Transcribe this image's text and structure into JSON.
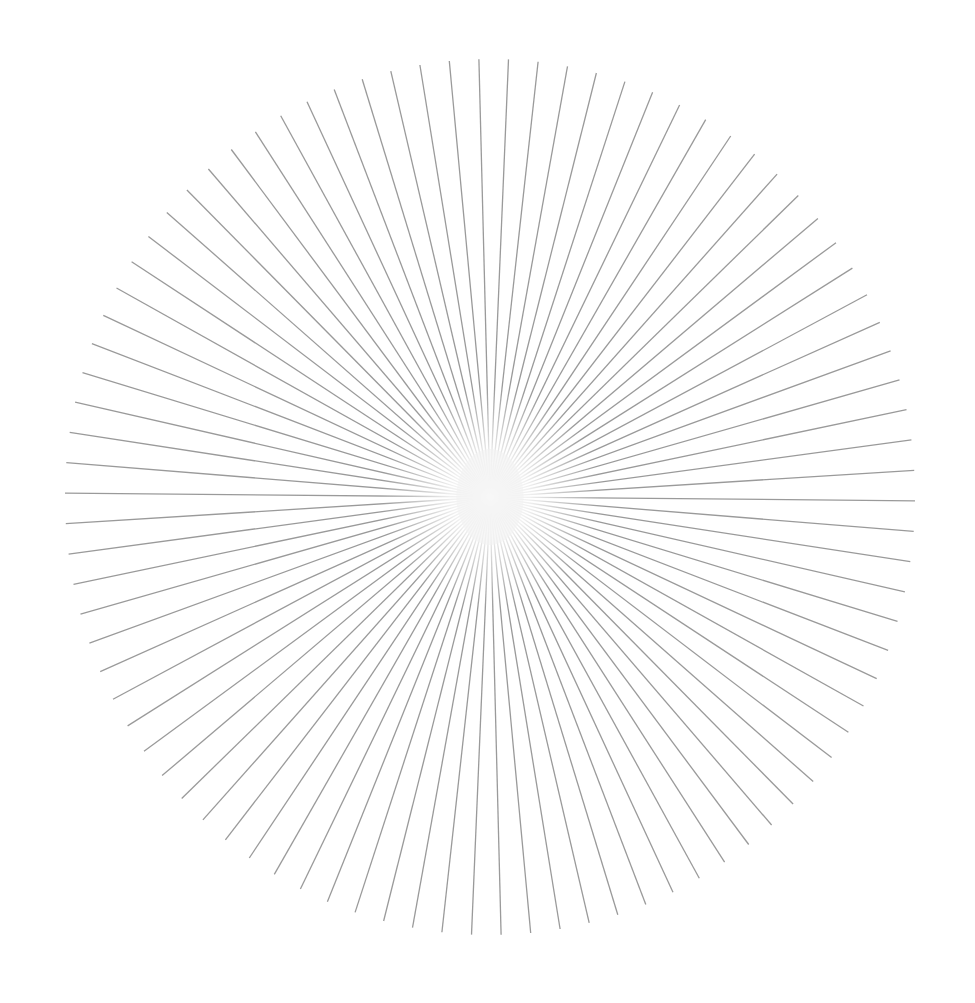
{
  "figure": {
    "type": "radial-starburst",
    "width": 975,
    "height": 1003,
    "background": "#ffffff",
    "center": {
      "x": 490,
      "y": 497
    },
    "radius_x": 425,
    "radius_y": 438,
    "line_count": 90,
    "angle_offset_deg": 0.5,
    "line_color": "#9a9a9a",
    "line_width": 1.3,
    "center_glow_radius": 48,
    "center_glow_color": "#f2f2f2"
  }
}
